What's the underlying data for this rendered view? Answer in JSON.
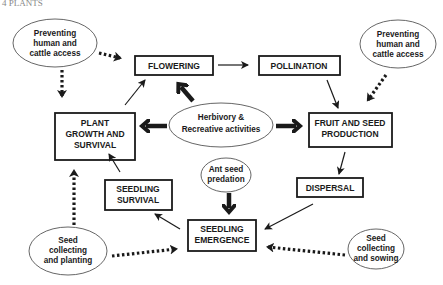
{
  "header": {
    "text": "4      PLANTS"
  },
  "boxes": {
    "flowering": "FLOWERING",
    "pollination": "POLLINATION",
    "plant_growth": [
      "PLANT",
      "GROWTH AND",
      "SURVIVAL"
    ],
    "fruit_seed": [
      "FRUIT AND SEED",
      "PRODUCTION"
    ],
    "dispersal": "DISPERSAL",
    "seedling_survival": [
      "SEEDLING",
      "SURVIVAL"
    ],
    "seedling_emergence": [
      "SEEDLING",
      "EMERGENCE"
    ]
  },
  "ellipses": {
    "prevent_left": [
      "Preventing",
      "human and",
      "cattle access"
    ],
    "prevent_right": [
      "Preventing",
      "human and",
      "cattle access"
    ],
    "herbivory": [
      "Herbivory  &",
      "Recreative activities"
    ],
    "ant": [
      "Ant seed",
      "predation"
    ],
    "seed_planting": [
      "Seed",
      "collecting",
      "and planting"
    ],
    "seed_sowing": [
      "Seed",
      "collecting",
      "and sowing"
    ]
  }
}
